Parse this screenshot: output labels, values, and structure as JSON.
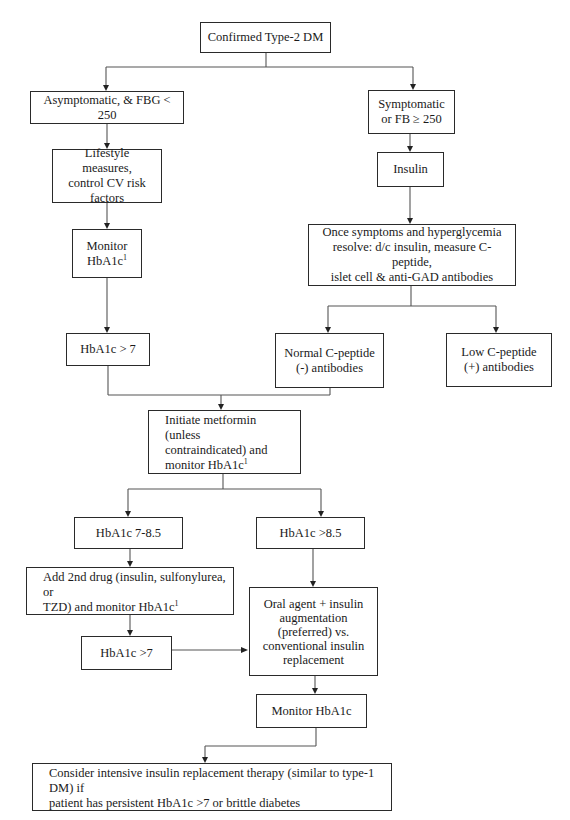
{
  "diagram": {
    "type": "flowchart",
    "title_node": "Confirmed Type-2 DM",
    "nodes": {
      "confirmed": {
        "text": "Confirmed Type-2 DM"
      },
      "asymptomatic": {
        "text": "Asymptomatic, & FBG < 250"
      },
      "symptomatic": {
        "line1": "Symptomatic",
        "line2": "or FB ≥ 250"
      },
      "lifestyle": {
        "line1": "Lifestyle measures,",
        "line2": "control CV risk",
        "line3": "factors"
      },
      "monitor1": {
        "line1": "Monitor",
        "line2": "HbA1c",
        "sup": "1"
      },
      "insulin": {
        "text": "Insulin"
      },
      "once_symptoms": {
        "line1": "Once symptoms and hyperglycemia",
        "line2": "resolve:  d/c insulin, measure C-peptide,",
        "line3": "islet cell & anti-GAD antibodies"
      },
      "hba1c_gt7": {
        "text": "HbA1c > 7"
      },
      "normal_cpep": {
        "line1": "Normal C-peptide",
        "line2": "(-) antibodies"
      },
      "low_cpep": {
        "line1": "Low C-peptide",
        "line2": "(+) antibodies"
      },
      "metformin": {
        "line1": "Initiate metformin (unless",
        "line2": "contraindicated) and",
        "line3": "monitor HbA1c",
        "sup": "1"
      },
      "hba1c_7_85": {
        "text": "HbA1c 7-8.5"
      },
      "hba1c_gt85": {
        "text": "HbA1c >8.5"
      },
      "second_drug": {
        "line1": "Add 2nd drug (insulin, sulfonylurea, or",
        "line2": "TZD) and monitor HbA1c",
        "sup": "1"
      },
      "hba1c_gt7_b": {
        "text": "HbA1c >7"
      },
      "oral_insulin": {
        "line1": "Oral agent + insulin",
        "line2": "augmentation",
        "line3": "(preferred) vs.",
        "line4": "conventional insulin",
        "line5": "replacement"
      },
      "monitor2": {
        "text": "Monitor HbA1c"
      },
      "intensive": {
        "line1": "Consider intensive insulin replacement therapy (similar to type-1 DM) if",
        "line2": "patient has persistent HbA1c >7 or brittle diabetes"
      }
    },
    "edges": [
      [
        "confirmed",
        "asymptomatic"
      ],
      [
        "confirmed",
        "symptomatic"
      ],
      [
        "asymptomatic",
        "lifestyle"
      ],
      [
        "lifestyle",
        "monitor1"
      ],
      [
        "monitor1",
        "hba1c_gt7"
      ],
      [
        "symptomatic",
        "insulin"
      ],
      [
        "insulin",
        "once_symptoms"
      ],
      [
        "once_symptoms",
        "normal_cpep"
      ],
      [
        "once_symptoms",
        "low_cpep"
      ],
      [
        "hba1c_gt7",
        "metformin"
      ],
      [
        "normal_cpep",
        "metformin"
      ],
      [
        "metformin",
        "hba1c_7_85"
      ],
      [
        "metformin",
        "hba1c_gt85"
      ],
      [
        "hba1c_7_85",
        "second_drug"
      ],
      [
        "second_drug",
        "hba1c_gt7_b"
      ],
      [
        "hba1c_gt7_b",
        "oral_insulin"
      ],
      [
        "hba1c_gt85",
        "oral_insulin"
      ],
      [
        "oral_insulin",
        "monitor2"
      ],
      [
        "monitor2",
        "intensive"
      ]
    ]
  }
}
